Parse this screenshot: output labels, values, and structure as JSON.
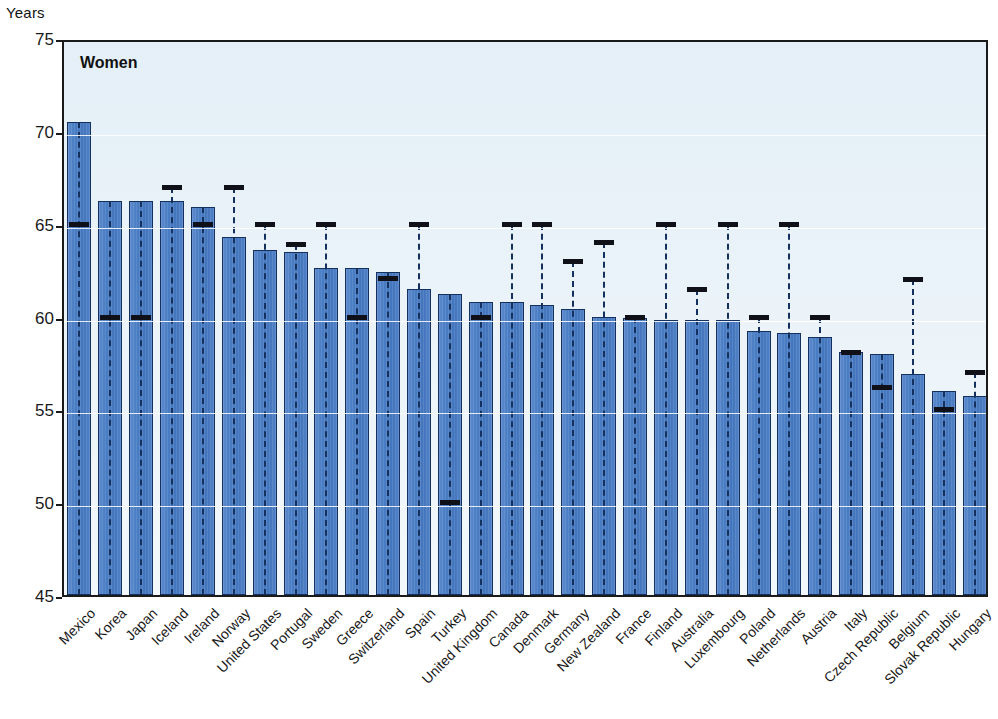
{
  "axis": {
    "unit_label": "Years",
    "y_ticks": [
      75,
      70,
      65,
      60,
      55,
      50,
      45
    ],
    "y_min": 45,
    "y_max": 75
  },
  "plot": {
    "title": "Women"
  },
  "colors": {
    "bar_fill": "#4a7ec4",
    "bar_edge": "#14305e",
    "marker": "#101018",
    "plot_background": "#e9f2f9",
    "frame": "#1a1a1a"
  },
  "chart_data": {
    "type": "bar",
    "title": "Women",
    "xlabel": "",
    "ylabel": "Years",
    "ylim": [
      45,
      75
    ],
    "grid": true,
    "legend": null,
    "categories": [
      "Mexico",
      "Korea",
      "Japan",
      "Iceland",
      "Ireland",
      "Norway",
      "United States",
      "Portugal",
      "Sweden",
      "Greece",
      "Switzerland",
      "Spain",
      "Turkey",
      "United Kingdom",
      "Canada",
      "Denmark",
      "Germany",
      "New Zealand",
      "France",
      "Finland",
      "Australia",
      "Luxembourg",
      "Poland",
      "Netherlands",
      "Austria",
      "Italy",
      "Czech Republic",
      "Belgium",
      "Slovak Republic",
      "Hungary"
    ],
    "series": [
      {
        "name": "Effective retirement age",
        "render": "bar",
        "values": [
          70.5,
          66.2,
          66.2,
          66.2,
          65.9,
          64.3,
          63.6,
          63.5,
          62.6,
          62.6,
          62.4,
          61.5,
          61.2,
          60.8,
          60.8,
          60.6,
          60.4,
          60.0,
          59.9,
          59.8,
          59.8,
          59.8,
          59.2,
          59.1,
          58.9,
          58.1,
          58.0,
          56.9,
          56.0,
          55.7
        ]
      },
      {
        "name": "Official retirement age",
        "render": "marker",
        "values": [
          65.0,
          60.0,
          60.0,
          67.0,
          65.0,
          67.0,
          65.0,
          63.9,
          65.0,
          60.0,
          62.1,
          65.0,
          50.0,
          60.0,
          65.0,
          65.0,
          63.0,
          64.0,
          60.0,
          65.0,
          61.5,
          65.0,
          60.0,
          65.0,
          60.0,
          58.1,
          56.2,
          62.0,
          55.0,
          57.0
        ]
      }
    ]
  }
}
